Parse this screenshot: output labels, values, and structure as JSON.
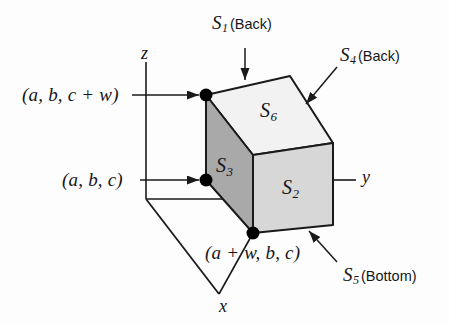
{
  "figure": {
    "background": "#fdfdfd",
    "axes": {
      "z_label": "z",
      "y_label": "y",
      "x_label": "x"
    },
    "callouts": [
      {
        "id": "s1",
        "symbol": "S",
        "subscript": "1",
        "suffix": "(Back)"
      },
      {
        "id": "s4",
        "symbol": "S",
        "subscript": "4",
        "suffix": "(Back)"
      },
      {
        "id": "s5",
        "symbol": "S",
        "subscript": "5",
        "suffix": "(Bottom)"
      }
    ],
    "face_labels": [
      {
        "id": "s6",
        "symbol": "S",
        "subscript": "6",
        "face": "top",
        "fill": "#f2f2f2"
      },
      {
        "id": "s3",
        "symbol": "S",
        "subscript": "3",
        "face": "left",
        "fill": "#a9a9a9"
      },
      {
        "id": "s2",
        "symbol": "S",
        "subscript": "2",
        "face": "front",
        "fill": "#d7d7d7"
      }
    ],
    "vertex_labels": [
      {
        "id": "top-left",
        "text": "(a, b, c + w)"
      },
      {
        "id": "mid-left",
        "text": "(a, b, c)"
      },
      {
        "id": "bottom",
        "text": "(a + w, b, c)"
      }
    ],
    "colors": {
      "stroke": "#1a1a1a",
      "top_face": "#f2f2f2",
      "left_face": "#a9a9a9",
      "front_face": "#d7d7d7",
      "vertex_dot": "#000000"
    }
  }
}
